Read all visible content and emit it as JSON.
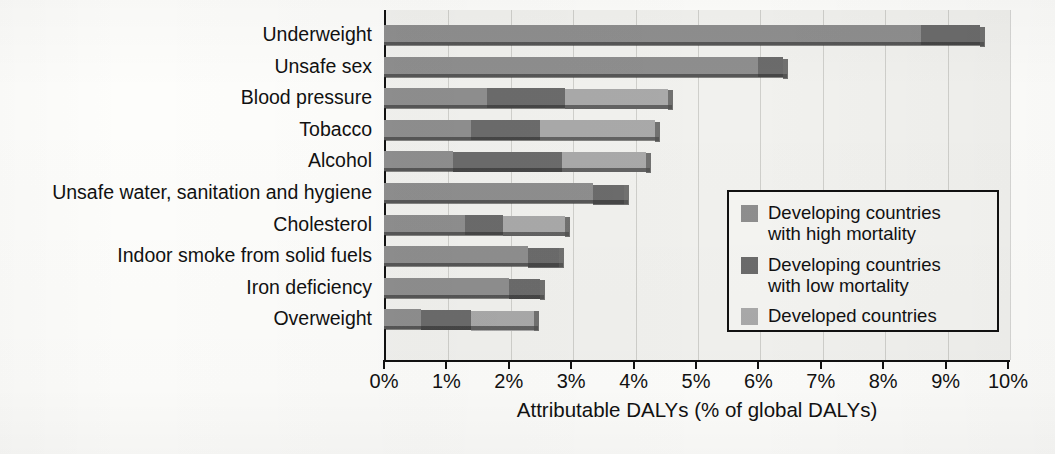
{
  "chart_data": {
    "type": "bar",
    "orientation": "horizontal",
    "stacked": true,
    "title": "",
    "xlabel": "Attributable DALYs (% of global DALYs)",
    "ylabel": "",
    "xlim": [
      0,
      10
    ],
    "xtick_labels": [
      "0%",
      "1%",
      "2%",
      "3%",
      "4%",
      "5%",
      "6%",
      "7%",
      "8%",
      "9%",
      "10%"
    ],
    "xtick_values": [
      0,
      1,
      2,
      3,
      4,
      5,
      6,
      7,
      8,
      9,
      10
    ],
    "grid": "vertical",
    "legend_position": "center-right-inside",
    "categories": [
      "Underweight",
      "Unsafe sex",
      "Blood pressure",
      "Tobacco",
      "Alcohol",
      "Unsafe water, sanitation and hygiene",
      "Cholesterol",
      "Indoor smoke from solid fuels",
      "Iron deficiency",
      "Overweight"
    ],
    "series": [
      {
        "name": "Developing countries with high mortality",
        "color": "#8e8e8e",
        "values": [
          8.6,
          6.0,
          1.65,
          1.4,
          1.1,
          3.35,
          1.3,
          2.3,
          2.0,
          0.6
        ]
      },
      {
        "name": "Developing countries with low mortality",
        "color": "#6b6b6b",
        "values": [
          0.95,
          0.4,
          1.25,
          1.1,
          1.75,
          0.5,
          0.6,
          0.5,
          0.5,
          0.8
        ]
      },
      {
        "name": "Developed countries",
        "color": "#a9a9a9",
        "values": [
          0.0,
          0.0,
          1.65,
          1.85,
          1.35,
          0.0,
          1.0,
          0.0,
          0.0,
          1.0
        ]
      }
    ],
    "totals": [
      9.55,
      6.4,
      4.55,
      4.35,
      4.2,
      3.85,
      2.9,
      2.8,
      2.5,
      2.4
    ]
  },
  "legend": {
    "items": [
      {
        "label": "Developing countries\nwith high mortality",
        "color": "#8e8e8e"
      },
      {
        "label": "Developing countries\nwith low mortality",
        "color": "#6b6b6b"
      },
      {
        "label": "Developed countries",
        "color": "#a9a9a9"
      }
    ]
  },
  "colors": {
    "high_mortality": "#8e8e8e",
    "low_mortality": "#6b6b6b",
    "developed": "#a9a9a9",
    "axis": "#111111",
    "plot_background": "#f1f1ee",
    "page_background": "#fdfdfb"
  }
}
